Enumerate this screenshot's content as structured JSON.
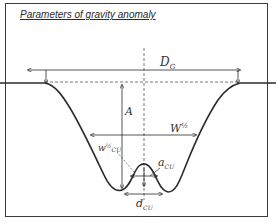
{
  "title": "Parameters of gravity anomaly",
  "labels": {
    "dg": "D",
    "dg_sub": "G",
    "a": "A",
    "w_half": "W",
    "w_half_sup": "½",
    "w_half_cu": "w",
    "w_half_cu_sup": "½",
    "w_half_cu_sub": "CU",
    "a_cu": "a",
    "a_cu_sub": "CU",
    "d_cu": "d",
    "d_cu_sub": "CU"
  },
  "colors": {
    "line": "#2b2b2b",
    "dash": "#555555",
    "text": "#333333"
  }
}
